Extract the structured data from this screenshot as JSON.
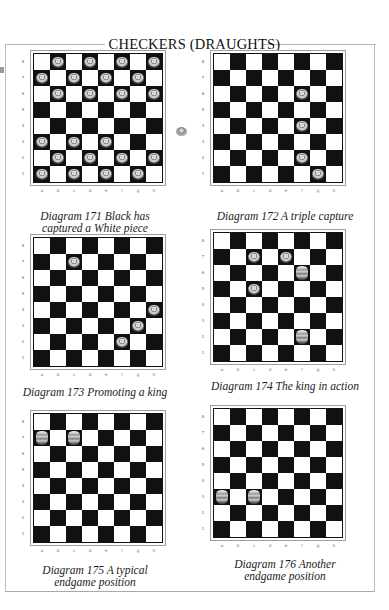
{
  "page": {
    "title": "CHECKERS (DRAUGHTS)",
    "colors": {
      "dark_square": "#111111",
      "light_square": "#ffffff",
      "frame": "#bdbdbd"
    }
  },
  "files": [
    "a",
    "b",
    "c",
    "d",
    "e",
    "f",
    "g",
    "h"
  ],
  "ranks": [
    "8",
    "7",
    "6",
    "5",
    "4",
    "3",
    "2",
    "1"
  ],
  "diagrams": [
    {
      "number": "171",
      "caption_line1": "Diagram 171  Black has",
      "caption_line2": "captured a White piece",
      "pieces": [
        {
          "sq": "b8",
          "king": false
        },
        {
          "sq": "d8",
          "king": false
        },
        {
          "sq": "f8",
          "king": false
        },
        {
          "sq": "h8",
          "king": false
        },
        {
          "sq": "a7",
          "king": false
        },
        {
          "sq": "c7",
          "king": false
        },
        {
          "sq": "e7",
          "king": false
        },
        {
          "sq": "g7",
          "king": false
        },
        {
          "sq": "b6",
          "king": false
        },
        {
          "sq": "d6",
          "king": false
        },
        {
          "sq": "f6",
          "king": false
        },
        {
          "sq": "h6",
          "king": false
        },
        {
          "sq": "a3",
          "king": false
        },
        {
          "sq": "c3",
          "king": false
        },
        {
          "sq": "e3",
          "king": false
        },
        {
          "sq": "b2",
          "king": false
        },
        {
          "sq": "d2",
          "king": false
        },
        {
          "sq": "f2",
          "king": false
        },
        {
          "sq": "h2",
          "king": false
        },
        {
          "sq": "a1",
          "king": false
        },
        {
          "sq": "c1",
          "king": false
        },
        {
          "sq": "e1",
          "king": false
        },
        {
          "sq": "g1",
          "king": false
        }
      ],
      "captured_piece_shown": true
    },
    {
      "number": "172",
      "caption_line1": "Diagram 172  A triple capture",
      "caption_line2": "",
      "pieces": [
        {
          "sq": "f6",
          "king": false
        },
        {
          "sq": "f4",
          "king": false
        },
        {
          "sq": "f2",
          "king": false
        },
        {
          "sq": "g1",
          "king": false
        }
      ]
    },
    {
      "number": "173",
      "caption_line1": "Diagram 173  Promoting a king",
      "caption_line2": "",
      "pieces": [
        {
          "sq": "c7",
          "king": false
        },
        {
          "sq": "h4",
          "king": false
        },
        {
          "sq": "g3",
          "king": false
        },
        {
          "sq": "f2",
          "king": false
        }
      ]
    },
    {
      "number": "174",
      "caption_line1": "Diagram 174  The king in action",
      "caption_line2": "",
      "pieces": [
        {
          "sq": "c7",
          "king": false
        },
        {
          "sq": "e7",
          "king": false
        },
        {
          "sq": "f6",
          "king": true
        },
        {
          "sq": "c5",
          "king": false
        },
        {
          "sq": "f2",
          "king": true
        }
      ]
    },
    {
      "number": "175",
      "caption_line1": "Diagram 175  A typical",
      "caption_line2": "endgame position",
      "pieces": [
        {
          "sq": "a7",
          "king": true
        },
        {
          "sq": "c7",
          "king": true
        }
      ]
    },
    {
      "number": "176",
      "caption_line1": "Diagram 176  Another",
      "caption_line2": "endgame position",
      "pieces": [
        {
          "sq": "a3",
          "king": true
        },
        {
          "sq": "c3",
          "king": true
        }
      ]
    }
  ]
}
